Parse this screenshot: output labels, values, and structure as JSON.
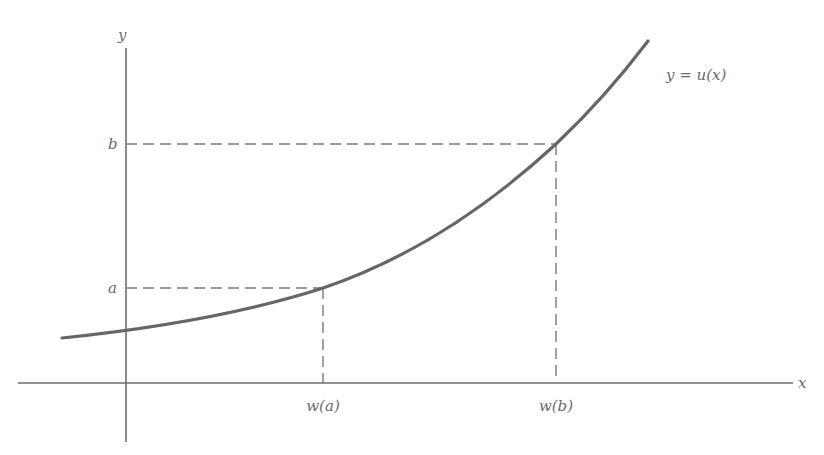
{
  "diagram": {
    "axes": {
      "x_label": "x",
      "y_label": "y"
    },
    "curve": {
      "label": "y = u(x)",
      "color": "#666666"
    },
    "points": [
      {
        "name": "a",
        "y_label": "a",
        "x_label": "w(a)"
      },
      {
        "name": "b",
        "y_label": "b",
        "x_label": "w(b)"
      }
    ]
  }
}
